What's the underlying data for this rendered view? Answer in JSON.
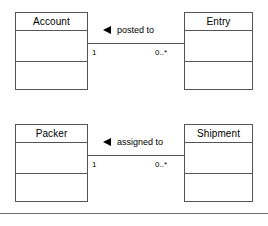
{
  "diagram": {
    "type": "uml-class-diagram",
    "background_color": "#ffffff",
    "line_color": "#555555",
    "text_color": "#000000",
    "associations": [
      {
        "id": "account-entry",
        "source_class": "Account",
        "target_class": "Entry",
        "label": "posted to",
        "reading_direction_marker": "solid-left-triangle",
        "source_multiplicity": "1",
        "target_multiplicity": "0..*"
      },
      {
        "id": "packer-shipment",
        "source_class": "Packer",
        "target_class": "Shipment",
        "label": "assigned to",
        "reading_direction_marker": "solid-left-triangle",
        "source_multiplicity": "1",
        "target_multiplicity": "0..*"
      }
    ],
    "classes": [
      {
        "id": "account",
        "name": "Account",
        "attributes": [],
        "operations": []
      },
      {
        "id": "entry",
        "name": "Entry",
        "attributes": [],
        "operations": []
      },
      {
        "id": "packer",
        "name": "Packer",
        "attributes": [],
        "operations": []
      },
      {
        "id": "shipment",
        "name": "Shipment",
        "attributes": [],
        "operations": []
      }
    ]
  }
}
